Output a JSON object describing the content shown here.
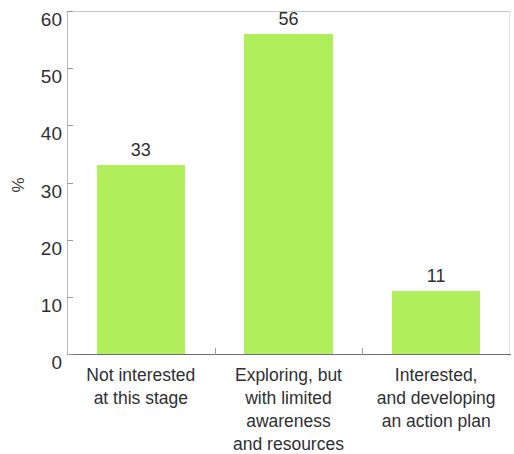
{
  "chart_data": {
    "type": "bar",
    "title": "",
    "subtitle": "",
    "xlabel": "",
    "ylabel": "%",
    "categories": [
      "Not interested\nat this stage",
      "Exploring, but\nwith limited\nawareness\nand resources",
      "Interested,\nand developing\nan action plan"
    ],
    "values": [
      33,
      56,
      11
    ],
    "data_labels": [
      "33",
      "56",
      "11"
    ],
    "ylim": [
      0,
      60
    ],
    "ytick_values": [
      0,
      10,
      20,
      30,
      40,
      50,
      60
    ],
    "ytick_labels": [
      "0",
      "10",
      "20",
      "30",
      "40",
      "50",
      "60"
    ],
    "grid": false,
    "legend": null,
    "legend_position": "none",
    "bar_color": "#b0ee5c",
    "axis_color": "#6e6e70",
    "text_color": "#2f2f31"
  }
}
